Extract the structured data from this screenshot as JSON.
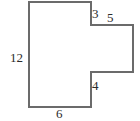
{
  "figure": {
    "type": "polygon-with-dimension-labels",
    "shape_name": "L-shaped-polygon",
    "stroke_color": "#6b6b6b",
    "fill_color": "#ffffff",
    "label_color": "#2b2b2b",
    "stroke_width": 2,
    "vertices": [
      [
        29,
        2
      ],
      [
        91,
        2
      ],
      [
        91,
        25
      ],
      [
        133,
        25
      ],
      [
        133,
        72
      ],
      [
        91,
        72
      ],
      [
        91,
        107
      ],
      [
        29,
        107
      ]
    ],
    "labels": {
      "left": "12",
      "top_step": "3",
      "right_arm": "5",
      "notch": "4",
      "bottom": "6"
    }
  }
}
